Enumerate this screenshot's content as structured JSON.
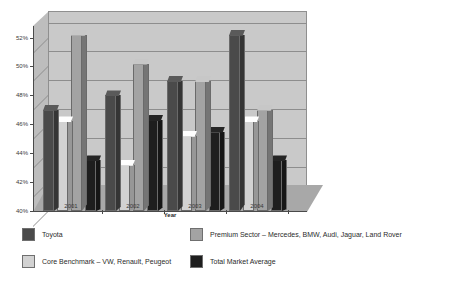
{
  "chart_data": {
    "type": "bar",
    "title": "Average Resale Value as Percentage of List Price",
    "xlabel": "Year",
    "ylabel": "",
    "categories": [
      "2001",
      "2002",
      "2003",
      "2004"
    ],
    "ylim": [
      40,
      52.8
    ],
    "ytick_labels": [
      "40%",
      "42%",
      "44%",
      "46%",
      "48%",
      "50%",
      "52%"
    ],
    "ytick_values": [
      40,
      42,
      44,
      46,
      48,
      50,
      52
    ],
    "grid": true,
    "legend_position": "bottom",
    "style": "3d-clustered-column",
    "series": [
      {
        "name": "Toyota",
        "color": "#4a4a4a",
        "values": [
          47.0,
          48.0,
          49.0,
          52.2
        ]
      },
      {
        "name": "Core Benchmark – VW, Renault, Peugeot",
        "color": "#d2d2d2",
        "values": [
          46.2,
          43.2,
          45.2,
          46.2
        ]
      },
      {
        "name": "Premium Sector – Mercedes, BMW, Audi, Jaguar, Land Rover",
        "color": "#a3a3a3",
        "values": [
          52.2,
          50.2,
          49.0,
          47.0
        ]
      },
      {
        "name": "Total Market Average",
        "color": "#1e1e1e",
        "values": [
          43.5,
          46.3,
          45.5,
          43.5
        ]
      }
    ]
  },
  "axis": {
    "x_title": "Year",
    "x_ticks": [
      "2001",
      "2002",
      "2003",
      "2004"
    ],
    "y_ticks": [
      "52%",
      "50%",
      "48%",
      "46%",
      "44%",
      "42%",
      "40%"
    ]
  },
  "legend": {
    "items": [
      {
        "label": "Toyota",
        "color": "#4a4a4a"
      },
      {
        "label": "Premium Sector – Mercedes, BMW, Audi, Jaguar, Land Rover",
        "color": "#a3a3a3"
      },
      {
        "label": "Core Benchmark – VW, Renault, Peugeot",
        "color": "#d2d2d2"
      },
      {
        "label": "Total Market Average",
        "color": "#1e1e1e"
      }
    ]
  },
  "colors": {
    "plot_background": "#c9c9c9",
    "side_wall": "#bdbdbd",
    "floor": "#a8a8a8",
    "gridline": "#8d8d8d",
    "axis": "#4a4a4a",
    "text": "#2b2b2b"
  }
}
